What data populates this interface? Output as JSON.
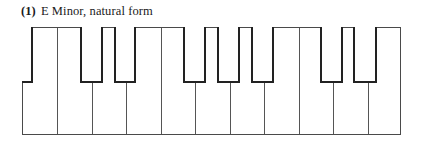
{
  "title": {
    "number": "(1)",
    "text": "E Minor,  natural form"
  },
  "keyboard": {
    "white_key_count": 11,
    "white_key_width": 34.45,
    "black_keys": [
      {
        "left": 0,
        "width": 10
      },
      {
        "left": 58,
        "width": 22
      },
      {
        "left": 92,
        "width": 22
      },
      {
        "left": 161,
        "width": 22
      },
      {
        "left": 195,
        "width": 22
      },
      {
        "left": 229,
        "width": 22
      },
      {
        "left": 298,
        "width": 22
      },
      {
        "left": 331,
        "width": 23
      }
    ],
    "outline_color": "#4a4a4a",
    "black_key_outline_color": "#222222"
  }
}
